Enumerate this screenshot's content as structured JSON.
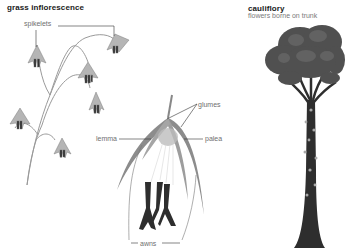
{
  "panels": {
    "grass": {
      "title": "grass inflorescence",
      "labels": {
        "spikelets": "spikelets",
        "glumes": "glumes",
        "lemma": "lemma",
        "palea": "palea",
        "awns": "awns"
      }
    },
    "cauliflory": {
      "title": "cauliflory",
      "subtitle": "flowers borne on trunk"
    }
  },
  "colors": {
    "foliage": "#4a4a4a",
    "trunk": "#2e2e2e",
    "spikelet": "#8a8a8a",
    "stem": "#9a9a9a",
    "leader_line": "#333333",
    "label_text": "#6f6f6f"
  }
}
